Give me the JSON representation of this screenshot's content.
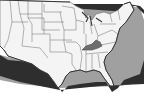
{
  "map": {
    "subject": "United States map",
    "highlighted_state": "Kentucky",
    "colors": {
      "land": "#f4f4f4",
      "borders": "#6a6a6a",
      "highlight": "#6e6e6e",
      "shadow_dark": "#2e2e2e",
      "shadow_light": "#9a9a9a",
      "background": "#ffffff"
    }
  }
}
